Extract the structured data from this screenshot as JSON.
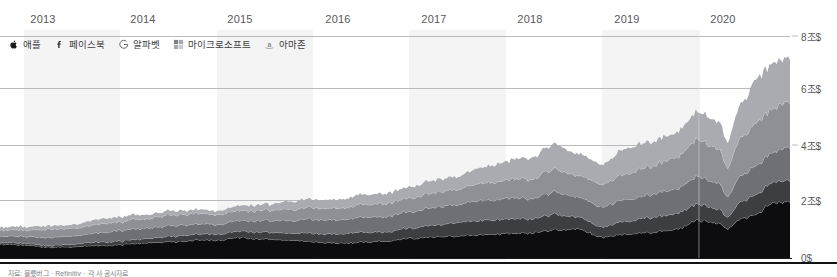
{
  "chart_data": {
    "type": "area",
    "stacked": true,
    "title": "",
    "subtitle": "",
    "xlabel": "",
    "ylabel": "",
    "xlim": [
      2012.75,
      2020.95
    ],
    "ylim": [
      0,
      8
    ],
    "grid": true,
    "grid_axis": "y",
    "legend_position": "top-left",
    "x_tick_labels": [
      "2013",
      "2014",
      "2015",
      "2016",
      "2017",
      "2018",
      "2019",
      "2020"
    ],
    "x_tick_values": [
      2013,
      2014,
      2015,
      2016,
      2017,
      2018,
      2019,
      2020
    ],
    "y_tick_labels": [
      "8조$",
      "6조$",
      "4조$",
      "2조$",
      "0$"
    ],
    "y_tick_values": [
      8,
      6,
      4,
      2,
      0
    ],
    "unit_note": "조$ = trillion USD",
    "series": [
      {
        "name": "애플",
        "icon": "apple-icon",
        "color": "#0d0d0f",
        "x": [
          2012.85,
          2013.0,
          2013.25,
          2013.5,
          2013.75,
          2014.0,
          2014.25,
          2014.5,
          2014.75,
          2015.0,
          2015.25,
          2015.5,
          2015.75,
          2016.0,
          2016.25,
          2016.5,
          2016.75,
          2017.0,
          2017.25,
          2017.5,
          2017.75,
          2018.0,
          2018.25,
          2018.5,
          2018.75,
          2019.0,
          2019.25,
          2019.5,
          2019.75,
          2020.0,
          2020.2,
          2020.3,
          2020.45,
          2020.6,
          2020.75,
          2020.92
        ],
        "values": [
          0.5,
          0.47,
          0.38,
          0.41,
          0.44,
          0.47,
          0.53,
          0.58,
          0.63,
          0.65,
          0.73,
          0.68,
          0.65,
          0.58,
          0.53,
          0.57,
          0.61,
          0.7,
          0.76,
          0.79,
          0.84,
          0.87,
          0.9,
          1.01,
          1.06,
          0.75,
          0.86,
          0.92,
          1.03,
          1.35,
          1.28,
          1.05,
          1.43,
          1.58,
          1.96,
          2.06
        ]
      },
      {
        "name": "페이스북",
        "icon": "facebook-icon",
        "color": "#3c3e42",
        "x": [
          2012.85,
          2013.0,
          2013.25,
          2013.5,
          2013.75,
          2014.0,
          2014.25,
          2014.5,
          2014.75,
          2015.0,
          2015.25,
          2015.5,
          2015.75,
          2016.0,
          2016.25,
          2016.5,
          2016.75,
          2017.0,
          2017.25,
          2017.5,
          2017.75,
          2018.0,
          2018.25,
          2018.5,
          2018.75,
          2019.0,
          2019.25,
          2019.5,
          2019.75,
          2020.0,
          2020.2,
          2020.3,
          2020.45,
          2020.6,
          2020.75,
          2020.92
        ],
        "values": [
          0.06,
          0.07,
          0.06,
          0.09,
          0.12,
          0.14,
          0.16,
          0.19,
          0.21,
          0.22,
          0.23,
          0.25,
          0.26,
          0.3,
          0.33,
          0.36,
          0.33,
          0.38,
          0.42,
          0.49,
          0.51,
          0.52,
          0.5,
          0.56,
          0.43,
          0.38,
          0.47,
          0.54,
          0.57,
          0.58,
          0.52,
          0.42,
          0.62,
          0.72,
          0.74,
          0.78
        ]
      },
      {
        "name": "알파벳",
        "icon": "google-icon",
        "color": "#6e7075",
        "x": [
          2012.85,
          2013.0,
          2013.25,
          2013.5,
          2013.75,
          2014.0,
          2014.25,
          2014.5,
          2014.75,
          2015.0,
          2015.25,
          2015.5,
          2015.75,
          2016.0,
          2016.25,
          2016.5,
          2016.75,
          2017.0,
          2017.25,
          2017.5,
          2017.75,
          2018.0,
          2018.25,
          2018.5,
          2018.75,
          2019.0,
          2019.25,
          2019.5,
          2019.75,
          2020.0,
          2020.2,
          2020.3,
          2020.45,
          2020.6,
          2020.75,
          2020.92
        ],
        "values": [
          0.23,
          0.24,
          0.29,
          0.3,
          0.34,
          0.37,
          0.38,
          0.39,
          0.37,
          0.36,
          0.37,
          0.43,
          0.45,
          0.5,
          0.5,
          0.54,
          0.55,
          0.59,
          0.64,
          0.65,
          0.72,
          0.75,
          0.73,
          0.8,
          0.73,
          0.73,
          0.79,
          0.82,
          0.89,
          0.99,
          0.93,
          0.76,
          0.95,
          1.02,
          1.08,
          1.19
        ]
      },
      {
        "name": "마이크로소프트",
        "icon": "microsoft-icon",
        "color": "#8e9095",
        "x": [
          2012.85,
          2013.0,
          2013.25,
          2013.5,
          2013.75,
          2014.0,
          2014.25,
          2014.5,
          2014.75,
          2015.0,
          2015.25,
          2015.5,
          2015.75,
          2016.0,
          2016.25,
          2016.5,
          2016.75,
          2017.0,
          2017.25,
          2017.5,
          2017.75,
          2018.0,
          2018.25,
          2018.5,
          2018.75,
          2019.0,
          2019.25,
          2019.5,
          2019.75,
          2020.0,
          2020.2,
          2020.3,
          2020.45,
          2020.6,
          2020.75,
          2020.92
        ],
        "values": [
          0.22,
          0.23,
          0.29,
          0.27,
          0.31,
          0.32,
          0.34,
          0.38,
          0.38,
          0.35,
          0.36,
          0.36,
          0.4,
          0.42,
          0.41,
          0.45,
          0.47,
          0.49,
          0.53,
          0.55,
          0.62,
          0.66,
          0.7,
          0.83,
          0.78,
          0.81,
          0.94,
          1.02,
          1.12,
          1.33,
          1.26,
          1.06,
          1.36,
          1.55,
          1.57,
          1.63
        ]
      },
      {
        "name": "아마존",
        "icon": "amazon-icon",
        "color": "#a9abb0",
        "x": [
          2012.85,
          2013.0,
          2013.25,
          2013.5,
          2013.75,
          2014.0,
          2014.25,
          2014.5,
          2014.75,
          2015.0,
          2015.25,
          2015.5,
          2015.75,
          2016.0,
          2016.25,
          2016.5,
          2016.75,
          2017.0,
          2017.25,
          2017.5,
          2017.75,
          2018.0,
          2018.25,
          2018.5,
          2018.75,
          2019.0,
          2019.25,
          2019.5,
          2019.75,
          2020.0,
          2020.2,
          2020.3,
          2020.45,
          2020.6,
          2020.75,
          2020.92
        ],
        "values": [
          0.11,
          0.12,
          0.12,
          0.13,
          0.18,
          0.18,
          0.15,
          0.15,
          0.14,
          0.14,
          0.18,
          0.21,
          0.28,
          0.3,
          0.31,
          0.36,
          0.36,
          0.4,
          0.45,
          0.47,
          0.56,
          0.67,
          0.77,
          0.91,
          0.78,
          0.73,
          0.91,
          0.89,
          0.88,
          1.01,
          0.97,
          0.93,
          1.24,
          1.56,
          1.62,
          1.59
        ]
      }
    ],
    "totals_note": "Combined market capitalization of the five largest US technology companies",
    "total_start": 1.12,
    "total_end": 7.25,
    "peak_value": 7.4,
    "covid_dip_x": 2020.3,
    "covid_dip_total": 4.22
  },
  "axis": {
    "years": [
      {
        "label": "2013",
        "x": 43
      },
      {
        "label": "2014",
        "x": 143
      },
      {
        "label": "2015",
        "x": 240
      },
      {
        "label": "2016",
        "x": 338
      },
      {
        "label": "2017",
        "x": 434
      },
      {
        "label": "2018",
        "x": 530
      },
      {
        "label": "2019",
        "x": 627
      },
      {
        "label": "2020",
        "x": 723
      }
    ],
    "yticks": [
      {
        "label": "8조$",
        "y": 36,
        "dash": true
      },
      {
        "label": "6조$",
        "y": 88,
        "dash": false
      },
      {
        "label": "4조$",
        "y": 145,
        "dash": true
      },
      {
        "label": "2조$",
        "y": 200,
        "dash": false
      },
      {
        "label": "0$",
        "y": 258,
        "dash": false
      }
    ]
  },
  "legend": {
    "items": [
      {
        "label": "애플",
        "icon": "apple-icon"
      },
      {
        "label": "페이스북",
        "icon": "facebook-icon"
      },
      {
        "label": "알파벳",
        "icon": "google-icon"
      },
      {
        "label": "마이크로소프트",
        "icon": "microsoft-icon"
      },
      {
        "label": "아마존",
        "icon": "amazon-icon"
      }
    ]
  },
  "colors": {
    "apple": "#0d0d0f",
    "facebook": "#3c3e42",
    "alphabet": "#6e7075",
    "microsoft": "#8e9095",
    "amazon": "#a9abb0",
    "gridline": "#b9babd",
    "band": "#f4f4f5",
    "background": "#ffffff",
    "text": "#57585a"
  },
  "source": {
    "text": "자료: 블룼버그 · Refinitiv · 각 사 공시자료"
  }
}
